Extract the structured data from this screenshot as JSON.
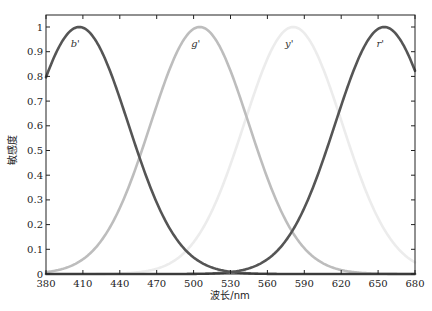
{
  "chart_data": {
    "type": "line",
    "title": "",
    "xlabel": "波长/nm",
    "ylabel": "敏感度",
    "xlim": [
      380,
      680
    ],
    "ylim": [
      0,
      1.05
    ],
    "grid": false,
    "x_ticks": [
      380,
      410,
      440,
      470,
      500,
      530,
      560,
      590,
      620,
      650,
      680
    ],
    "y_ticks": [
      0,
      0.1,
      0.2,
      0.3,
      0.4,
      0.5,
      0.6,
      0.7,
      0.8,
      0.9,
      1
    ],
    "y_tick_labels": [
      "0",
      "0.1",
      "0.2",
      "0.3",
      "0.4",
      "0.5",
      "0.6",
      "0.7",
      "0.8",
      "0.9",
      "1"
    ],
    "series": [
      {
        "name": "b'",
        "peak_nm": 407,
        "peak_value": 1.0,
        "sigma_nm": 40,
        "color": "#555555",
        "label_pos": [
          407,
          0.92
        ]
      },
      {
        "name": "g'",
        "peak_nm": 505,
        "peak_value": 1.0,
        "sigma_nm": 40,
        "color": "#bdbdbd",
        "label_pos": [
          505,
          0.92
        ]
      },
      {
        "name": "y'",
        "peak_nm": 581,
        "peak_value": 1.0,
        "sigma_nm": 40,
        "color": "#ececec",
        "label_pos": [
          581,
          0.92
        ]
      },
      {
        "name": "r'",
        "peak_nm": 655,
        "peak_value": 1.0,
        "sigma_nm": 40,
        "color": "#555555",
        "label_pos": [
          655,
          0.92
        ]
      }
    ],
    "legend": "inline labels near peaks"
  }
}
